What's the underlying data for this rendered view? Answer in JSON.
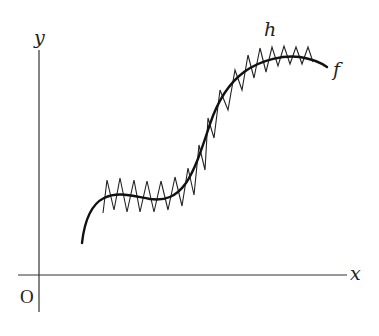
{
  "figure": {
    "axes": {
      "x_label": "x",
      "y_label": "y",
      "origin_label": "O"
    },
    "curves": [
      {
        "id": "f",
        "label": "f",
        "style": "thick smooth curve"
      },
      {
        "id": "h",
        "label": "h",
        "style": "thin zigzag oscillating around f"
      }
    ],
    "colors": {
      "ink": "#111111",
      "axis": "#333333",
      "background": "#ffffff"
    }
  },
  "chart_data": {
    "type": "line",
    "title": "",
    "xlabel": "x",
    "ylabel": "y",
    "grid": false,
    "legend": "inline labels (h above curve, f at right end)",
    "series": [
      {
        "name": "f",
        "description": "smooth S-shaped increasing curve with a small hump/plateau on the left and leveling off on the right",
        "points_px": [
          [
            82,
            243
          ],
          [
            88,
            218
          ],
          [
            98,
            201
          ],
          [
            115,
            194
          ],
          [
            135,
            195
          ],
          [
            155,
            200
          ],
          [
            172,
            196
          ],
          [
            188,
            180
          ],
          [
            200,
            155
          ],
          [
            210,
            125
          ],
          [
            222,
            95
          ],
          [
            240,
            72
          ],
          [
            260,
            60
          ],
          [
            285,
            55
          ],
          [
            305,
            58
          ],
          [
            327,
            67
          ]
        ]
      },
      {
        "name": "h",
        "description": "piecewise-linear zigzag approximating f with small, rapid oscillations",
        "points_px": [
          [
            103,
            213
          ],
          [
            107,
            180
          ],
          [
            114,
            210
          ],
          [
            120,
            178
          ],
          [
            127,
            212
          ],
          [
            134,
            180
          ],
          [
            140,
            212
          ],
          [
            147,
            181
          ],
          [
            154,
            212
          ],
          [
            161,
            181
          ],
          [
            168,
            210
          ],
          [
            175,
            177
          ],
          [
            182,
            206
          ],
          [
            188,
            168
          ],
          [
            194,
            195
          ],
          [
            199,
            145
          ],
          [
            205,
            170
          ],
          [
            208,
            118
          ],
          [
            214,
            138
          ],
          [
            220,
            90
          ],
          [
            228,
            110
          ],
          [
            235,
            70
          ],
          [
            242,
            90
          ],
          [
            248,
            55
          ],
          [
            254,
            78
          ],
          [
            260,
            48
          ],
          [
            266,
            72
          ],
          [
            272,
            47
          ],
          [
            278,
            66
          ],
          [
            284,
            46
          ],
          [
            290,
            64
          ],
          [
            296,
            47
          ],
          [
            302,
            64
          ],
          [
            308,
            47
          ],
          [
            313,
            62
          ]
        ]
      }
    ]
  }
}
